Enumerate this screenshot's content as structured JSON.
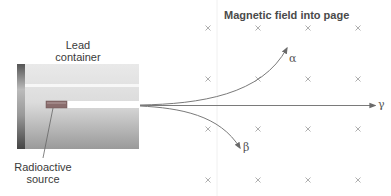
{
  "diagram": {
    "title": "Magnetic field into page",
    "container_label": [
      "Lead",
      "container"
    ],
    "source_label": [
      "Radioactive",
      "source"
    ],
    "field_symbol": "×",
    "field_grid": {
      "columns_x": [
        208,
        258,
        308,
        358
      ],
      "rows_y": [
        28,
        79,
        129,
        180
      ]
    },
    "rays": [
      {
        "name": "alpha",
        "symbol": "α",
        "deflection": "up"
      },
      {
        "name": "gamma",
        "symbol": "γ",
        "deflection": "none"
      },
      {
        "name": "beta",
        "symbol": "β",
        "deflection": "down"
      }
    ],
    "colors": {
      "ray": "#7a7a7a",
      "arrowhead": "#6a6a6a",
      "field_marker": "#9a9a9a",
      "container_light": "#e6e6e6",
      "container_dark": "#8c8c8c",
      "source": "#8a6d6d"
    }
  }
}
